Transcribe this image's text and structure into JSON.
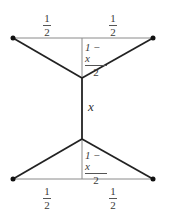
{
  "figure": {
    "colors": {
      "heavy_edge": "#222222",
      "light_edge": "#888888",
      "dot": "#111111",
      "text": "#333333"
    }
  },
  "nodes": {
    "top_left": {
      "x": 13,
      "y": 38
    },
    "top_right": {
      "x": 153,
      "y": 38
    },
    "top_mid": {
      "x": 82,
      "y": 38
    },
    "upper_junction": {
      "x": 82,
      "y": 78
    },
    "lower_junction": {
      "x": 82,
      "y": 139
    },
    "bottom_mid": {
      "x": 82,
      "y": 179
    },
    "bottom_left": {
      "x": 13,
      "y": 179
    },
    "bottom_right": {
      "x": 153,
      "y": 179
    }
  },
  "labels": {
    "top_left_half": {
      "num": "1",
      "den": "2"
    },
    "top_right_half": {
      "num": "1",
      "den": "2"
    },
    "upper_height": {
      "num": "1 − x",
      "den": "2"
    },
    "middle_edge": "x",
    "lower_height": {
      "num": "1 − x",
      "den": "2"
    },
    "bottom_left_half": {
      "num": "1",
      "den": "2"
    },
    "bottom_right_half": {
      "num": "1",
      "den": "2"
    }
  }
}
